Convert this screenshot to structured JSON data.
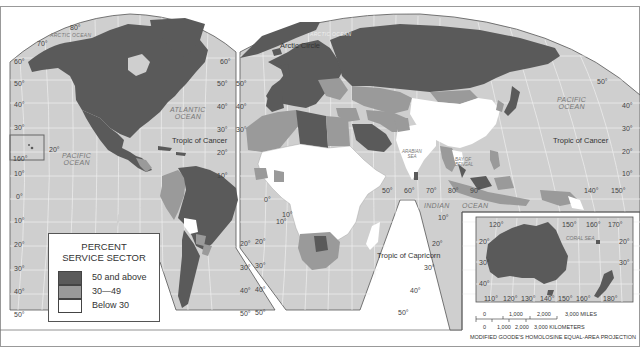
{
  "legend": {
    "title_line1": "PERCENT",
    "title_line2": "SERVICE SECTOR",
    "items": [
      {
        "label": "50 and above",
        "color": "#5a5a5a"
      },
      {
        "label": "30—49",
        "color": "#9a9a9a"
      },
      {
        "label": "Below 30",
        "color": "#ffffff"
      }
    ]
  },
  "oceans": {
    "arctic_left": "ARCTIC OCEAN",
    "arctic_right": "ARCTIC OCEAN",
    "atlantic_line1": "ATLANTIC",
    "atlantic_line2": "OCEAN",
    "pacific_left_line1": "PACIFIC",
    "pacific_left_line2": "OCEAN",
    "pacific_right_line1": "PACIFIC",
    "pacific_right_line2": "OCEAN",
    "indian_1": "INDIAN",
    "indian_2": "OCEAN",
    "arabian_line1": "ARABIAN",
    "arabian_line2": "SEA",
    "bengal_line1": "BAY OF",
    "bengal_line2": "BENGAL",
    "coral": "CORAL SEA"
  },
  "lines": {
    "arctic_circle": "Arctic Circle",
    "tropic_cancer_left": "Tropic of Cancer",
    "tropic_cancer_right": "Tropic of Cancer",
    "tropic_capricorn": "Tropic of Capricorn"
  },
  "lat_labels_left": [
    "80°",
    "70°",
    "60°",
    "50°",
    "40°",
    "30°",
    "20°",
    "160°",
    "10°",
    "0°",
    "10°",
    "20°",
    "30°",
    "40°",
    "50°"
  ],
  "lat_labels_mid_left": [
    "60°",
    "50°",
    "40°",
    "30°",
    "20°",
    "10°",
    "0°",
    "10°",
    "20°",
    "30°",
    "40°",
    "50°"
  ],
  "lat_labels_mid_right": [
    "50°",
    "40°",
    "30°",
    "20°",
    "10°",
    "20°",
    "30°",
    "40°",
    "50°"
  ],
  "lat_labels_right": [
    "50°",
    "40°",
    "30°",
    "20°",
    "10°"
  ],
  "lon_labels_equator": [
    "50°",
    "60°",
    "70°",
    "80°",
    "90°",
    "140°",
    "150°"
  ],
  "inset": {
    "top_labels": [
      "120°",
      "150°",
      "160°",
      "170°"
    ],
    "bottom_labels": [
      "110°",
      "120°",
      "130°",
      "140°",
      "150°",
      "160°",
      "180°"
    ],
    "left_labels": [
      "20°",
      "30°",
      "40°"
    ],
    "right_labels": [
      "20°",
      "30°"
    ]
  },
  "scale": {
    "miles": [
      "0",
      "1,000",
      "2,000",
      "3,000 MILES"
    ],
    "km": [
      "0",
      "1,000",
      "2,000",
      "3,000 KILOMETERS"
    ]
  },
  "projection": "MODIFIED GOODE'S HOMOLOSINE EQUAL-AREA PROJECTION",
  "colors": {
    "ocean": "#cfcfcf",
    "dark": "#5a5a5a",
    "mid": "#9a9a9a",
    "light": "#ffffff",
    "grid": "#f2f2f2"
  }
}
